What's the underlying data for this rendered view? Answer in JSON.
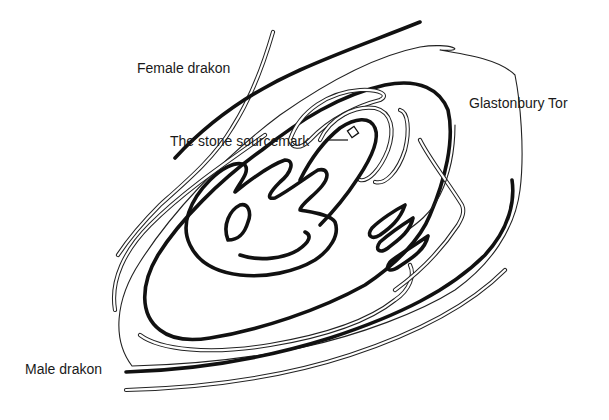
{
  "diagram": {
    "labels": {
      "female_drakon": "Female drakon",
      "male_drakon": "Male drakon",
      "glastonbury_tor": "Glastonbury Tor",
      "stone_sourcemark": "The stone sourcemark"
    },
    "colors": {
      "background": "#ffffff",
      "line": "#111111",
      "text": "#1a1a1a"
    }
  }
}
